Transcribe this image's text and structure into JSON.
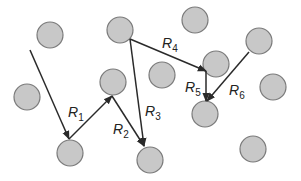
{
  "diagram": {
    "type": "random-walk / vector path diagram",
    "node_style": {
      "fill": "#c8c8c8",
      "stroke": "#7a7a7a",
      "radius": 13
    },
    "edge_color": "#2a2a2a",
    "nodes": [
      {
        "id": "n1",
        "cx": 50,
        "cy": 35
      },
      {
        "id": "n2",
        "cx": 27,
        "cy": 97
      },
      {
        "id": "n3",
        "cx": 70,
        "cy": 153
      },
      {
        "id": "n4",
        "cx": 113,
        "cy": 82
      },
      {
        "id": "n5",
        "cx": 120,
        "cy": 30
      },
      {
        "id": "n6",
        "cx": 150,
        "cy": 160
      },
      {
        "id": "n7",
        "cx": 162,
        "cy": 75
      },
      {
        "id": "n8",
        "cx": 195,
        "cy": 20
      },
      {
        "id": "n9",
        "cx": 216,
        "cy": 64
      },
      {
        "id": "n10",
        "cx": 259,
        "cy": 41
      },
      {
        "id": "n11",
        "cx": 273,
        "cy": 87
      },
      {
        "id": "n12",
        "cx": 205,
        "cy": 114
      },
      {
        "id": "n13",
        "cx": 253,
        "cy": 149
      }
    ],
    "edges": [
      {
        "id": "e0",
        "x1": 30,
        "y1": 50,
        "x2": 69,
        "y2": 139,
        "label": ""
      },
      {
        "id": "e1",
        "x1": 69,
        "y1": 139,
        "x2": 112,
        "y2": 96,
        "label": "R",
        "sub": "1"
      },
      {
        "id": "e2",
        "x1": 112,
        "y1": 96,
        "x2": 144,
        "y2": 146,
        "label": "R",
        "sub": "2"
      },
      {
        "id": "e3",
        "x1": 130,
        "y1": 39,
        "x2": 144,
        "y2": 146,
        "label": "R",
        "sub": "3"
      },
      {
        "id": "e4",
        "x1": 130,
        "y1": 39,
        "x2": 206,
        "y2": 71,
        "label": "R",
        "sub": "4"
      },
      {
        "id": "e5",
        "x1": 206,
        "y1": 71,
        "x2": 206,
        "y2": 101,
        "label": "R",
        "sub": "5"
      },
      {
        "id": "e6",
        "x1": 249,
        "y1": 52,
        "x2": 207,
        "y2": 101,
        "label": "R",
        "sub": "6"
      }
    ],
    "labels": [
      {
        "text": "R",
        "sub": "1",
        "x": 68,
        "y": 117
      },
      {
        "text": "R",
        "sub": "2",
        "x": 113,
        "y": 134
      },
      {
        "text": "R",
        "sub": "3",
        "x": 145,
        "y": 116
      },
      {
        "text": "R",
        "sub": "4",
        "x": 162,
        "y": 48
      },
      {
        "text": "R",
        "sub": "5",
        "x": 185,
        "y": 92
      },
      {
        "text": "R",
        "sub": "6",
        "x": 229,
        "y": 95
      }
    ]
  }
}
